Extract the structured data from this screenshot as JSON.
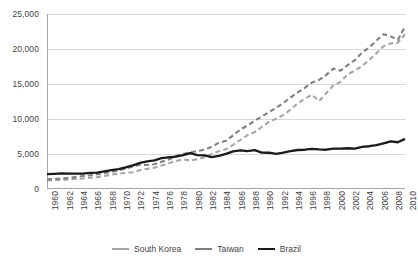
{
  "chart_data": {
    "type": "line",
    "title": "",
    "subtitle": "",
    "xlabel": "",
    "ylabel": "",
    "xlim": [
      1960,
      2010
    ],
    "ylim": [
      0,
      25000
    ],
    "grid": true,
    "legend_position": "bottom",
    "y_ticks": [
      0,
      5000,
      10000,
      15000,
      20000,
      25000
    ],
    "y_tick_labels": [
      "0",
      "5,000",
      "10,000",
      "15,000",
      "20,000",
      "25,000"
    ],
    "x_ticks": [
      1960,
      1962,
      1964,
      1966,
      1968,
      1970,
      1972,
      1974,
      1976,
      1978,
      1980,
      1982,
      1984,
      1986,
      1988,
      1990,
      1992,
      1994,
      1996,
      1998,
      2000,
      2002,
      2004,
      2006,
      2008,
      2010
    ],
    "x_tick_labels": [
      "1960",
      "1962",
      "1964",
      "1966",
      "1968",
      "1970",
      "1972",
      "1974",
      "1976",
      "1978",
      "1980",
      "1982",
      "1984",
      "1986",
      "1988",
      "1990",
      "1992",
      "1994",
      "1996",
      "1998",
      "2000",
      "2002",
      "2004",
      "2006",
      "2008",
      "2010"
    ],
    "x": [
      1960,
      1961,
      1962,
      1963,
      1964,
      1965,
      1966,
      1967,
      1968,
      1969,
      1970,
      1971,
      1972,
      1973,
      1974,
      1975,
      1976,
      1977,
      1978,
      1979,
      1980,
      1981,
      1982,
      1983,
      1984,
      1985,
      1986,
      1987,
      1988,
      1989,
      1990,
      1991,
      1992,
      1993,
      1994,
      1995,
      1996,
      1997,
      1998,
      1999,
      2000,
      2001,
      2002,
      2003,
      2004,
      2005,
      2006,
      2007,
      2008,
      2009,
      2010
    ],
    "series": [
      {
        "name": "South Korea",
        "color": "#a6a6a6",
        "style": "dashed",
        "width": 2.1,
        "values": [
          1250,
          1280,
          1300,
          1380,
          1440,
          1500,
          1620,
          1700,
          1840,
          2060,
          2180,
          2300,
          2400,
          2700,
          2880,
          3030,
          3360,
          3680,
          4000,
          4230,
          4060,
          4270,
          4520,
          4990,
          5380,
          5690,
          6300,
          7000,
          7700,
          8130,
          8860,
          9580,
          10050,
          10550,
          11330,
          12200,
          12900,
          13450,
          12550,
          13700,
          14800,
          15300,
          16400,
          16900,
          17600,
          18400,
          19400,
          20400,
          20800,
          20900,
          22100
        ]
      },
      {
        "name": "Taiwan",
        "color": "#808080",
        "style": "dashed",
        "width": 2.1,
        "values": [
          1380,
          1430,
          1490,
          1580,
          1720,
          1850,
          1970,
          2120,
          2270,
          2440,
          2660,
          2920,
          3220,
          3480,
          3430,
          3530,
          3900,
          4200,
          4720,
          5010,
          5210,
          5430,
          5620,
          6040,
          6600,
          6880,
          7680,
          8480,
          9080,
          9760,
          10350,
          10970,
          11600,
          12290,
          13050,
          13800,
          14450,
          15200,
          15580,
          16300,
          17200,
          16900,
          17700,
          18400,
          19500,
          20200,
          21200,
          22100,
          21800,
          21300,
          23200
        ]
      },
      {
        "name": "Brazil",
        "color": "#1a1a1a",
        "style": "solid",
        "width": 2.3,
        "values": [
          2120,
          2160,
          2220,
          2190,
          2200,
          2210,
          2290,
          2340,
          2510,
          2680,
          2830,
          3080,
          3380,
          3740,
          3960,
          4080,
          4400,
          4510,
          4640,
          4850,
          5130,
          4850,
          4800,
          4550,
          4740,
          5030,
          5380,
          5520,
          5420,
          5560,
          5200,
          5180,
          5010,
          5180,
          5420,
          5570,
          5610,
          5720,
          5650,
          5610,
          5770,
          5770,
          5820,
          5770,
          6030,
          6110,
          6280,
          6530,
          6790,
          6680,
          7160
        ]
      }
    ]
  },
  "legend": {
    "items": [
      {
        "label": "South Korea",
        "color": "#a6a6a6"
      },
      {
        "label": "Taiwan",
        "color": "#808080"
      },
      {
        "label": "Brazil",
        "color": "#1a1a1a"
      }
    ]
  }
}
